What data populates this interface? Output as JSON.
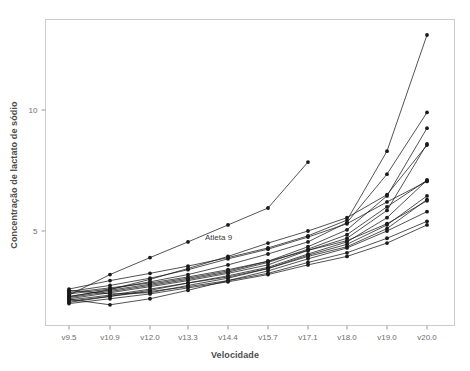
{
  "chart_data": {
    "type": "line",
    "title": "",
    "xlabel": "Velocidade",
    "ylabel": "Concentração de lactato de sódio",
    "categories": [
      "v9.5",
      "v10.9",
      "v12.0",
      "v13.3",
      "v14.4",
      "v15.7",
      "v17.1",
      "v18.0",
      "v19.0",
      "v20.0"
    ],
    "ytick_labels": [
      "5",
      "10"
    ],
    "ytick_values": [
      5,
      10
    ],
    "ylim": [
      1.2,
      13.8
    ],
    "grid": false,
    "legend": "none",
    "annotations": [
      {
        "text": "Atleta 9",
        "x_category": "v14.4",
        "y": 4.7
      }
    ],
    "marker": "filled-circle",
    "line_color": "#1a1a1a",
    "panel_background": "#ffffff",
    "panel_border_color": "#cccccc",
    "series": [
      {
        "name": "Atleta 1",
        "values": [
          2.3,
          2.55,
          2.8,
          3.05,
          3.35,
          3.75,
          4.35,
          5.05,
          6.45,
          9.25
        ]
      },
      {
        "name": "Atleta 2",
        "values": [
          2.2,
          2.45,
          2.7,
          2.95,
          3.25,
          3.6,
          4.2,
          4.7,
          5.85,
          8.6
        ]
      },
      {
        "name": "Atleta 3",
        "values": [
          2.4,
          2.6,
          2.9,
          3.2,
          3.6,
          4.05,
          4.55,
          5.35,
          7.35,
          9.9
        ]
      },
      {
        "name": "Atleta 4",
        "values": [
          2.05,
          2.3,
          2.55,
          2.85,
          3.15,
          3.5,
          4.05,
          4.55,
          5.55,
          7.1
        ]
      },
      {
        "name": "Atleta 5",
        "values": [
          2.5,
          2.75,
          3.05,
          3.4,
          3.85,
          4.25,
          4.75,
          5.3,
          6.2,
          7.05
        ]
      },
      {
        "name": "Atleta 6",
        "values": [
          2.15,
          2.35,
          2.6,
          2.85,
          3.1,
          3.45,
          3.95,
          4.35,
          5.1,
          6.3
        ]
      },
      {
        "name": "Atleta 7",
        "values": [
          2.6,
          2.95,
          3.25,
          3.55,
          3.9,
          4.3,
          4.8,
          5.45,
          8.3,
          13.1
        ]
      },
      {
        "name": "Atleta 8",
        "values": [
          2.25,
          2.5,
          2.75,
          3.0,
          3.3,
          3.7,
          4.25,
          4.85,
          6.0,
          7.1
        ]
      },
      {
        "name": "Atleta 9",
        "values": [
          2.35,
          3.2,
          3.9,
          4.55,
          5.25,
          5.95,
          7.85,
          null,
          null,
          null
        ]
      },
      {
        "name": "Atleta 10",
        "values": [
          2.1,
          2.3,
          2.5,
          2.7,
          2.95,
          3.25,
          3.7,
          4.1,
          4.7,
          5.4
        ]
      },
      {
        "name": "Atleta 11",
        "values": [
          2.45,
          2.65,
          2.85,
          3.1,
          3.4,
          3.75,
          4.2,
          4.6,
          5.3,
          6.25
        ]
      },
      {
        "name": "Atleta 12",
        "values": [
          2.0,
          2.2,
          2.4,
          2.65,
          2.9,
          3.2,
          3.6,
          3.95,
          4.5,
          5.25
        ]
      },
      {
        "name": "Atleta 13",
        "values": [
          2.55,
          2.4,
          2.45,
          2.75,
          3.05,
          3.45,
          4.0,
          4.45,
          5.25,
          6.45
        ]
      },
      {
        "name": "Atleta 14",
        "values": [
          2.28,
          2.58,
          3.0,
          3.45,
          3.95,
          4.5,
          5.0,
          5.55,
          6.5,
          8.55
        ]
      },
      {
        "name": "Atleta 15",
        "values": [
          2.18,
          1.95,
          2.2,
          2.55,
          2.95,
          3.35,
          3.85,
          4.3,
          5.0,
          5.8
        ]
      }
    ]
  },
  "axes": {
    "x_title": "Velocidade",
    "y_title": "Concentração de lactato de sódio"
  }
}
